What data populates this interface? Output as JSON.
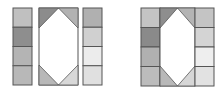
{
  "figures": [
    {
      "id": "figure-1",
      "left_column": {
        "x": 13,
        "y": 8,
        "w": 19,
        "h": 77,
        "cells": [
          "#c0c0c0",
          "#8e8e8e",
          "#b4b4b4",
          "#b8b8b8"
        ]
      },
      "hexagon_panel": {
        "x": 39,
        "y": 8,
        "w": 39,
        "h": 77,
        "tri_top_left": "#8c8c8c",
        "tri_top_right": "#b2b2b2",
        "tri_bottom_left": "#b8b8b8",
        "tri_bottom_right": "#d8d8d8",
        "tip": 20
      },
      "right_column": {
        "x": 83,
        "y": 8,
        "w": 19,
        "h": 77,
        "cells": [
          "#b0b0b0",
          "#d0d0d0",
          "#ececec",
          "#e0e0e0"
        ]
      }
    },
    {
      "id": "figure-2",
      "left_column": {
        "x": 141,
        "y": 8,
        "w": 19,
        "h": 78,
        "cells": [
          "#c4c4c4",
          "#8a8a8a",
          "#b0b0b0",
          "#bcbcbc"
        ]
      },
      "hexagon_panel": {
        "x": 160,
        "y": 8,
        "w": 35,
        "h": 78,
        "tri_top_left": "#8e8e8e",
        "tri_top_right": "#b4b4b4",
        "tri_bottom_left": "#b8b8b8",
        "tri_bottom_right": "#d6d6d6",
        "tip": 20
      },
      "right_column": {
        "x": 195,
        "y": 8,
        "w": 19,
        "h": 78,
        "cells": [
          "#c4c4c4",
          "#d4d4d4",
          "#eeeeee",
          "#e2e2e2"
        ]
      }
    }
  ],
  "stroke": "#555555"
}
